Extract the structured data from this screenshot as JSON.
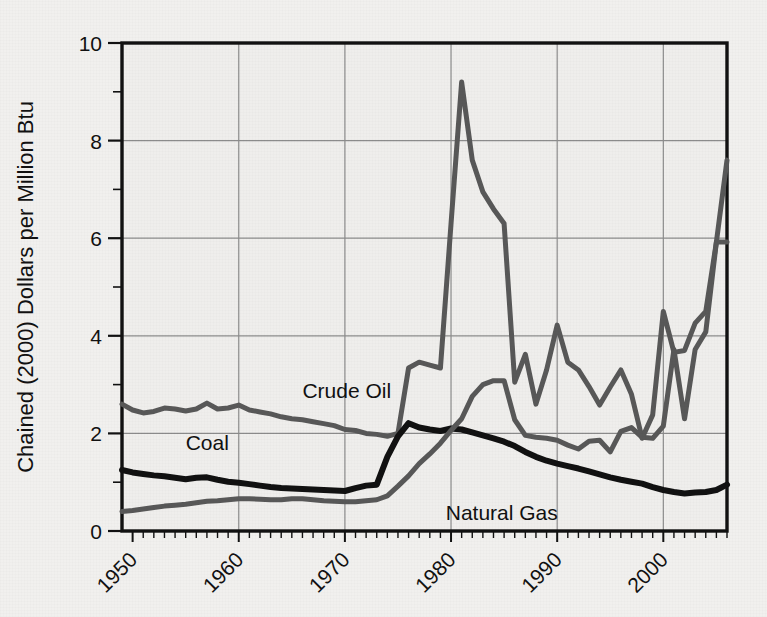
{
  "chart_data": {
    "type": "line",
    "title": "",
    "xlabel": "",
    "ylabel": "Chained (2000) Dollars per Million Btu",
    "xlim": [
      1949,
      2006
    ],
    "ylim": [
      0,
      10
    ],
    "grid": true,
    "legend_position": "inline-labels",
    "y_ticks": [
      "0",
      "2",
      "4",
      "6",
      "8",
      "10"
    ],
    "y_tick_values": [
      0,
      2,
      4,
      6,
      8,
      10
    ],
    "x_ticks": [
      "1950",
      "1960",
      "1970",
      "1980",
      "1990",
      "2000"
    ],
    "x_tick_values": [
      1950,
      1960,
      1970,
      1980,
      1990,
      2000
    ],
    "x": [
      1949,
      1950,
      1951,
      1952,
      1953,
      1954,
      1955,
      1956,
      1957,
      1958,
      1959,
      1960,
      1961,
      1962,
      1963,
      1964,
      1965,
      1966,
      1967,
      1968,
      1969,
      1970,
      1971,
      1972,
      1973,
      1974,
      1975,
      1976,
      1977,
      1978,
      1979,
      1980,
      1981,
      1982,
      1983,
      1984,
      1985,
      1986,
      1987,
      1988,
      1989,
      1990,
      1991,
      1992,
      1993,
      1994,
      1995,
      1996,
      1997,
      1998,
      1999,
      2000,
      2001,
      2002,
      2003,
      2004,
      2005,
      2006
    ],
    "series": [
      {
        "name": "Crude Oil",
        "color": "#585858",
        "width": 5,
        "label_x": 1966.0,
        "label_y": 2.72,
        "values": [
          2.6,
          2.48,
          2.42,
          2.45,
          2.52,
          2.5,
          2.46,
          2.5,
          2.62,
          2.5,
          2.52,
          2.58,
          2.48,
          2.44,
          2.4,
          2.34,
          2.3,
          2.28,
          2.24,
          2.2,
          2.16,
          2.08,
          2.06,
          2.0,
          1.98,
          1.94,
          2.0,
          3.34,
          3.46,
          3.4,
          3.34,
          6.3,
          9.2,
          7.6,
          6.95,
          6.6,
          6.3,
          3.05,
          3.62,
          2.6,
          3.3,
          4.22,
          3.46,
          3.3,
          2.96,
          2.58,
          2.95,
          3.3,
          2.8,
          1.9,
          2.38,
          4.5,
          3.66,
          3.7,
          4.26,
          4.5,
          5.92,
          7.6
        ]
      },
      {
        "name": "Coal",
        "color": "#111111",
        "width": 6,
        "label_x": 1955.0,
        "label_y": 1.66,
        "values": [
          1.25,
          1.2,
          1.17,
          1.14,
          1.12,
          1.09,
          1.06,
          1.09,
          1.1,
          1.05,
          1.01,
          0.99,
          0.96,
          0.93,
          0.9,
          0.88,
          0.87,
          0.86,
          0.85,
          0.84,
          0.83,
          0.82,
          0.88,
          0.93,
          0.95,
          1.52,
          1.94,
          2.21,
          2.12,
          2.08,
          2.05,
          2.1,
          2.08,
          2.02,
          1.96,
          1.9,
          1.83,
          1.74,
          1.62,
          1.52,
          1.44,
          1.38,
          1.33,
          1.28,
          1.22,
          1.16,
          1.1,
          1.05,
          1.01,
          0.97,
          0.9,
          0.84,
          0.8,
          0.77,
          0.79,
          0.8,
          0.84,
          0.95
        ]
      },
      {
        "name": "Natural Gas",
        "color": "#585858",
        "width": 5,
        "label_x": 1979.5,
        "label_y": 0.22,
        "values": [
          0.4,
          0.42,
          0.45,
          0.48,
          0.51,
          0.53,
          0.55,
          0.58,
          0.61,
          0.62,
          0.64,
          0.66,
          0.66,
          0.65,
          0.64,
          0.64,
          0.66,
          0.66,
          0.64,
          0.62,
          0.61,
          0.6,
          0.6,
          0.62,
          0.64,
          0.72,
          0.92,
          1.13,
          1.38,
          1.58,
          1.8,
          2.06,
          2.3,
          2.76,
          3.0,
          3.08,
          3.08,
          2.28,
          1.96,
          1.92,
          1.9,
          1.86,
          1.76,
          1.68,
          1.84,
          1.86,
          1.62,
          2.04,
          2.12,
          1.92,
          1.9,
          2.15,
          3.72,
          2.3,
          3.72,
          4.08,
          5.92,
          5.92
        ]
      }
    ]
  },
  "plot": {
    "left": 122,
    "top": 43,
    "right": 727,
    "bottom": 531
  }
}
